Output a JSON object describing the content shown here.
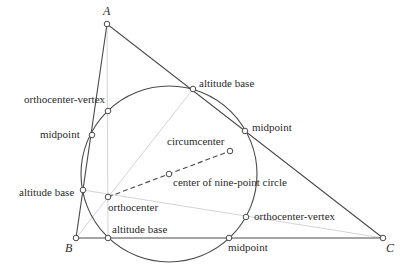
{
  "diagram": {
    "title": "Nine-point circle",
    "vertices": [
      {
        "id": "A",
        "label": "A",
        "x": 107,
        "y": 24,
        "lx": 103,
        "ly": 15
      },
      {
        "id": "B",
        "label": "B",
        "x": 76,
        "y": 238,
        "lx": 66,
        "ly": 251
      },
      {
        "id": "C",
        "label": "C",
        "x": 383,
        "y": 238,
        "lx": 386,
        "ly": 251
      }
    ],
    "labels": {
      "altitude_base_ac": "altitude base",
      "midpoint_ac": "midpoint",
      "orthocenter_vertex_top": "orthocenter-vertex",
      "midpoint_ab": "midpoint",
      "circumcenter": "circumcenter",
      "center_nine_point": "center of nine-point circle",
      "altitude_base_ab": "altitude base",
      "orthocenter": "orthocenter",
      "orthocenter_vertex_right": "orthocenter-vertex",
      "altitude_base_bc": "altitude base",
      "midpoint_bc": "midpoint"
    },
    "nine_point_circle": {
      "cx": 169,
      "cy": 174,
      "r": 88
    },
    "points": {
      "orthocenter": [
        108,
        197
      ],
      "circumcenter": [
        230,
        151
      ],
      "nine_point_center": [
        169,
        174
      ],
      "altitude_base_ab": [
        83,
        190
      ],
      "altitude_base_ac": [
        193,
        89
      ],
      "altitude_base_bc": [
        108,
        238
      ],
      "midpoint_ab": [
        92,
        135
      ],
      "midpoint_ac": [
        245,
        131
      ],
      "midpoint_bc": [
        229,
        238
      ],
      "ohv_top": [
        108,
        111
      ],
      "ohv_right": [
        246,
        217
      ]
    },
    "colors": {
      "stroke": "#4a4a4a",
      "altitude": "#d4d4d4",
      "text": "#2a2a2a",
      "background": "#ffffff"
    }
  }
}
